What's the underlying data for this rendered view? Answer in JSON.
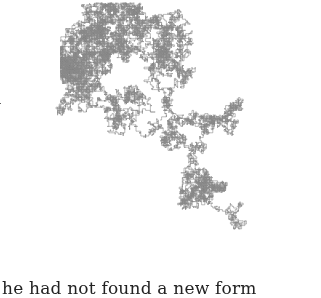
{
  "figure": {
    "stroke_color": "#8a8a8a",
    "bounds": {
      "x0": 8,
      "y0": 0,
      "x1": 310,
      "y1": 258
    }
  },
  "text": {
    "margin_fragment": "l",
    "bottom_line": "he had not found a new form"
  }
}
